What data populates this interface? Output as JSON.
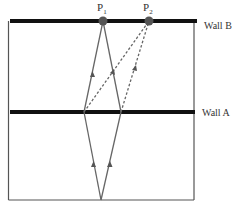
{
  "diagram": {
    "walls": [
      {
        "name": "Wall B",
        "label": "Wall B",
        "y": 21
      },
      {
        "name": "Wall A",
        "label": "Wall A",
        "y": 112
      }
    ],
    "points": [
      {
        "id": "P1",
        "label": "P",
        "subscript": "1",
        "x": 103,
        "y": 21
      },
      {
        "id": "P2",
        "label": "P",
        "subscript": "2",
        "x": 149,
        "y": 21
      }
    ],
    "source": {
      "x": 101,
      "y": 200
    },
    "rays": {
      "solid": "source to Wall A reflections to P1",
      "dashed": "Wall A reflections to P2"
    },
    "colors": {
      "wall": "#111111",
      "ray": "#666666",
      "point": "#555555",
      "box": "#444444"
    }
  }
}
